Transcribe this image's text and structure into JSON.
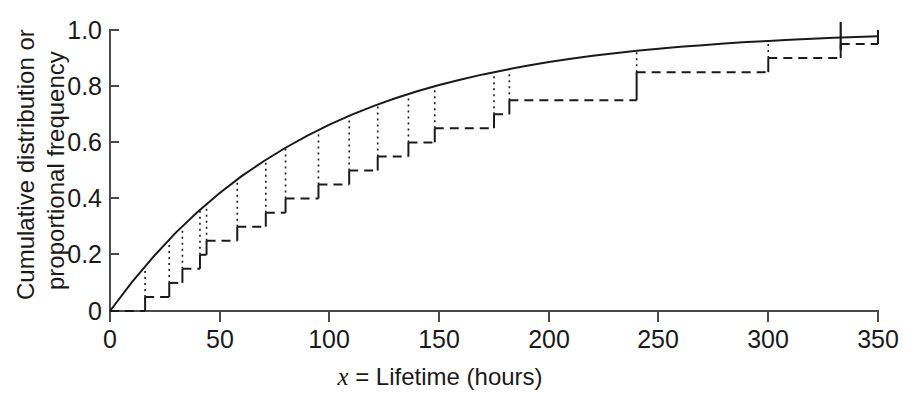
{
  "figure": {
    "title": "",
    "background_color": "#ffffff",
    "ink_color": "#1a1a1a"
  },
  "axes": {
    "x": {
      "label_italic": "x",
      "label_rest": " = Lifetime (hours)",
      "label_full": "x = Lifetime (hours)",
      "ticks": [
        "0",
        "50",
        "100",
        "150",
        "200",
        "250",
        "300",
        "350"
      ],
      "tick_values": [
        0,
        50,
        100,
        150,
        200,
        250,
        300,
        350
      ],
      "min": 0,
      "max": 350
    },
    "y": {
      "label_line1": "Cumulative distribution or",
      "label_line2": "proportional frequency",
      "label_full": "Cumulative distribution or proportional frequency",
      "ticks": [
        "0",
        "0.2",
        "0.4",
        "0.6",
        "0.8",
        "1.0"
      ],
      "tick_values": [
        0,
        0.2,
        0.4,
        0.6,
        0.8,
        1.0
      ],
      "min": 0,
      "max": 1.0
    }
  },
  "chart_data": {
    "type": "line",
    "title": "",
    "xlabel": "x = Lifetime (hours)",
    "ylabel": "Cumulative distribution or proportional frequency",
    "xlim": [
      0,
      350
    ],
    "ylim": [
      0,
      1.0
    ],
    "grid": false,
    "legend": "none",
    "series": [
      {
        "name": "Fitted exponential cumulative distribution",
        "style": "solid",
        "type": "line",
        "description": "Smooth theoretical exponential CDF F(x) = 1 - exp(-x/92)",
        "mean_parameter": 92,
        "x": [
          0,
          10,
          20,
          30,
          40,
          50,
          60,
          70,
          80,
          90,
          100,
          110,
          120,
          130,
          140,
          150,
          160,
          170,
          180,
          190,
          200,
          210,
          220,
          230,
          240,
          250,
          260,
          270,
          280,
          290,
          300,
          310,
          320,
          330,
          340,
          350
        ],
        "y": [
          0.0,
          0.103,
          0.195,
          0.279,
          0.353,
          0.42,
          0.48,
          0.533,
          0.581,
          0.624,
          0.663,
          0.698,
          0.729,
          0.757,
          0.782,
          0.804,
          0.824,
          0.842,
          0.858,
          0.873,
          0.886,
          0.898,
          0.908,
          0.917,
          0.926,
          0.933,
          0.94,
          0.946,
          0.952,
          0.957,
          0.961,
          0.965,
          0.969,
          0.972,
          0.975,
          0.978
        ]
      },
      {
        "name": "Empirical cumulative distribution (sample)",
        "style": "dashed-step",
        "type": "step",
        "description": "Observed step function of 20 lifetimes; vertical jumps at each observation",
        "n": 20,
        "observations": [
          16,
          27,
          33,
          41,
          44,
          58,
          71,
          80,
          95,
          109,
          122,
          136,
          148,
          175,
          182,
          240,
          300,
          333
        ],
        "step_x": [
          0,
          16,
          27,
          33,
          41,
          44,
          58,
          71,
          80,
          95,
          109,
          122,
          136,
          148,
          175,
          182,
          240,
          300,
          333,
          350
        ],
        "step_y": [
          0.0,
          0.05,
          0.1,
          0.15,
          0.2,
          0.25,
          0.3,
          0.35,
          0.4,
          0.45,
          0.5,
          0.55,
          0.6,
          0.65,
          0.7,
          0.75,
          0.85,
          0.9,
          0.95,
          1.0
        ]
      }
    ],
    "annotations": [
      {
        "name": "final-observation-mark",
        "description": "Vertical tick at the largest observation reaching 1.0",
        "x": 333,
        "y_from": 0.93,
        "y_to": 1.0
      }
    ]
  }
}
